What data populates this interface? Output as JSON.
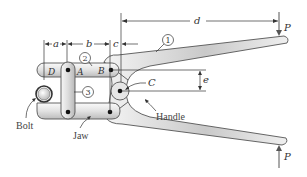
{
  "figure": {
    "dimensions": {
      "a": "a",
      "b": "b",
      "c": "c",
      "d": "d",
      "e": "e"
    },
    "points": {
      "A": "A",
      "B": "B",
      "C": "C",
      "D": "D"
    },
    "members": {
      "m1": "1",
      "m2": "2",
      "m3": "3"
    },
    "loads": {
      "top": "P",
      "bottom": "P"
    },
    "callouts": {
      "bolt": "Bolt",
      "jaw": "Jaw",
      "handle": "Handle"
    },
    "colors": {
      "outline": "#555555",
      "fill_light": "#f2f2f2",
      "fill_dark": "#bdbdbd",
      "text": "#333333"
    }
  }
}
